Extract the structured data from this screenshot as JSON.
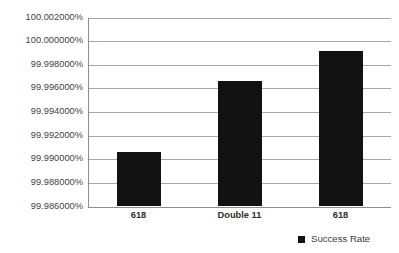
{
  "chart_data": {
    "type": "bar",
    "title": "",
    "xlabel": "",
    "ylabel": "",
    "categories": [
      "618",
      "Double 11",
      "618"
    ],
    "series": [
      {
        "name": "Success Rate",
        "values": [
          99.99065,
          99.99666,
          99.9992
        ]
      }
    ],
    "ylim": [
      99.986,
      100.002
    ],
    "ytick_step": 0.002,
    "ytick_labels": [
      "100.002000%",
      "100.000000%",
      "99.998000%",
      "99.996000%",
      "99.994000%",
      "99.992000%",
      "99.990000%",
      "99.988000%",
      "99.986000%"
    ],
    "ytick_values": [
      100.002,
      100.0,
      99.998,
      99.996,
      99.994,
      99.992,
      99.99,
      99.988,
      99.986
    ],
    "grid": true,
    "grid_axis": "y",
    "legend": {
      "position": "bottom-right",
      "entries": [
        {
          "label": "Success Rate",
          "color": "#121212"
        }
      ]
    },
    "colors": {
      "bar": "#121212",
      "gridline": "#a8a8a8",
      "axis": "#8d8d8d",
      "text": "#3a3a3a",
      "background": "#ffffff"
    }
  }
}
